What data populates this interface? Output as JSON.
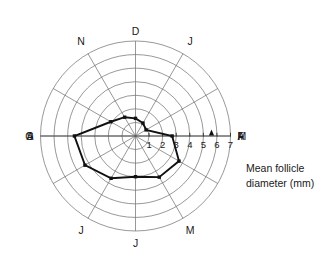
{
  "chart_data": {
    "type": "line",
    "polar": true,
    "title": "",
    "subtitle": "",
    "xlabel": "",
    "ylabel": "Mean follicle diameter (mm)",
    "annotation": "Mean follicle diameter (mm)",
    "annotation_lines": [
      "Mean  follicle",
      "diameter (mm)"
    ],
    "categories": [
      "D",
      "J",
      "F",
      "M",
      "A",
      "M",
      "J",
      "J",
      "A",
      "S",
      "O",
      "N"
    ],
    "category_full_names": [
      "December",
      "January",
      "February",
      "March",
      "April",
      "May",
      "June",
      "July",
      "August",
      "September",
      "October",
      "November"
    ],
    "values": [
      1.3,
      1.1,
      0.9,
      2.7,
      3.7,
      3.5,
      3.0,
      3.6,
      4.3,
      4.5,
      2.1,
      1.6
    ],
    "series": [
      {
        "name": "Mean follicle diameter",
        "values": [
          1.3,
          1.1,
          0.9,
          2.7,
          3.7,
          3.5,
          3.0,
          3.6,
          4.3,
          4.5,
          2.1,
          1.6
        ]
      }
    ],
    "rlim": [
      0,
      7
    ],
    "r_ticks": [
      1,
      2,
      3,
      4,
      5,
      6,
      7
    ],
    "r_tick_labels": [
      "1",
      "2",
      "3",
      "4",
      "5",
      "6",
      "7"
    ],
    "ring_count": 7,
    "spoke_count": 12,
    "grid": true,
    "legend": "none",
    "tick_axis_direction": "M",
    "marker_arrow": {
      "label": "",
      "value": 5.6,
      "axis": "M",
      "shape": "up-triangle"
    },
    "colors": {
      "series": "#111111",
      "grid": "#6b6b6b",
      "axis": "#4a4a4a",
      "text": "#1a1a1a",
      "background": "#ffffff"
    }
  },
  "labels": {
    "months": [
      "D",
      "J",
      "F",
      "M",
      "A",
      "M",
      "J",
      "J",
      "A",
      "S",
      "O",
      "N"
    ],
    "radial_ticks": [
      "1",
      "2",
      "3",
      "4",
      "5",
      "6",
      "7"
    ],
    "annotation_line_1": "Mean  follicle",
    "annotation_line_2": "diameter (mm)"
  }
}
